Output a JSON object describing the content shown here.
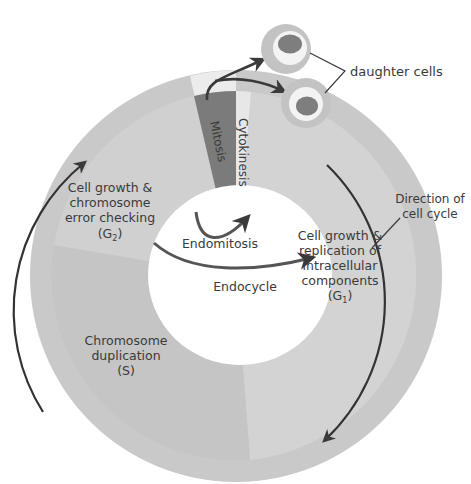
{
  "diagram": {
    "type": "cell-cycle",
    "colors": {
      "outer_ring": "#c9c9c9",
      "g1_fill": "#d2d2d2",
      "g2_fill": "#cfcfcf",
      "s_fill": "#c4c4c4",
      "mitosis_fill": "#7a7a7a",
      "mitosis_outer": "#ededed",
      "cytokinesis_fill": "#e6e6e6",
      "arrow": "#3a3a3a",
      "cell_outer": "#c2c2c2",
      "cell_cytoplasm": "#f3f3f3",
      "cell_nucleus": "#7e7e7e",
      "text": "#3a3a3a"
    },
    "phases": {
      "mitosis": "Mitosis",
      "cytokinesis": "Cytokinesis",
      "g2": {
        "line1": "Cell growth &",
        "line2": "chromosome",
        "line3": "error checking",
        "symbol": "G",
        "subscript": "2"
      },
      "g1": {
        "line1": "Cell growth &",
        "line2": "replication of",
        "line3": "intracellular",
        "line4": "components",
        "symbol": "G",
        "subscript": "1"
      },
      "s": {
        "line1": "Chromosome",
        "line2": "duplication",
        "line3": "(S)"
      }
    },
    "inner_paths": {
      "endomitosis": "Endomitosis",
      "endocycle": "Endocycle"
    },
    "callouts": {
      "daughter_cells": "daughter cells",
      "direction_line1": "Direction of",
      "direction_line2": "cell cycle"
    }
  }
}
